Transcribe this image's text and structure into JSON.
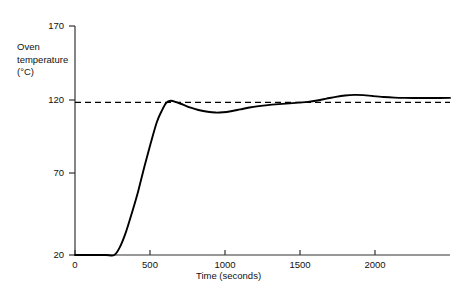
{
  "chart_data": {
    "type": "line",
    "title": "",
    "subtitle": "",
    "xlabel": "Time (seconds)",
    "ylabel": "Oven temperature (°C)",
    "ylabel_lines": [
      "Oven",
      "temperature",
      "(°C)"
    ],
    "xlim": [
      0,
      2430
    ],
    "ylim": [
      20,
      170
    ],
    "xticks": [
      0,
      500,
      1000,
      1500,
      2000
    ],
    "xticklabels": [
      "0",
      "500",
      "1000",
      "1500",
      "2000"
    ],
    "yticks": [
      20,
      70,
      120,
      170
    ],
    "yticklabels": [
      "20",
      "70",
      "120",
      "170"
    ],
    "grid": false,
    "legend": null,
    "line_color": "#000000",
    "axis_color": "#333333",
    "setpoint": {
      "label": "120",
      "value": 120,
      "style": "dashed",
      "color": "#000000"
    },
    "series": [
      {
        "name": "Oven temperature response",
        "x": [
          0,
          120,
          200,
          255,
          290,
          330,
          370,
          410,
          450,
          490,
          530,
          560,
          590,
          620,
          660,
          700,
          750,
          800,
          860,
          910,
          960,
          1010,
          1070,
          1130,
          1190,
          1250,
          1320,
          1390,
          1450,
          1510,
          1570,
          1630,
          1690,
          1750,
          1810,
          1870,
          1930,
          2000,
          2070,
          2140,
          2220,
          2300,
          2430
        ],
        "y": [
          20,
          20,
          20,
          20,
          25,
          35,
          48,
          62,
          78,
          93,
          107,
          114,
          119.5,
          121,
          120,
          118.5,
          116.5,
          115,
          113.8,
          113.3,
          113.5,
          114.2,
          115.4,
          116.6,
          117.5,
          118.2,
          118.8,
          119.3,
          119.8,
          120.3,
          121.2,
          122.4,
          123.6,
          124.5,
          124.9,
          124.7,
          124.1,
          123.5,
          123.1,
          122.9,
          122.8,
          122.8,
          122.9
        ]
      }
    ],
    "annotations": [
      {
        "text": "curve begins rising from 20 °C at about 255 seconds"
      },
      {
        "text": "first overshoot peak about 121 °C near 620 seconds"
      },
      {
        "text": "undershoot trough about 113 °C near 910 seconds"
      },
      {
        "text": "second overshoot peak about 125 °C near 1810 seconds"
      },
      {
        "text": "settles at about 123 °C"
      }
    ]
  }
}
